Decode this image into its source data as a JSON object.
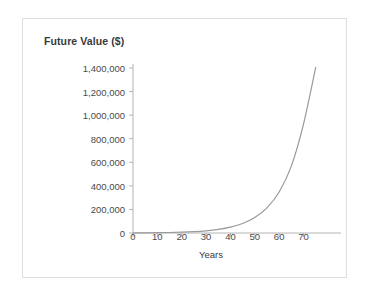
{
  "figure": {
    "title": "Future Value ($)",
    "border_color": "#dededd",
    "background": "#ffffff"
  },
  "chart_data": {
    "type": "line",
    "title": "Future Value ($)",
    "xlabel": "Years",
    "ylabel": "Future Value ($)",
    "xlim": [
      0,
      78
    ],
    "ylim": [
      0,
      1400000
    ],
    "grid": false,
    "legend": null,
    "line_color": "#9a9a9a",
    "line_width": 1.2,
    "x_ticks": [
      0,
      10,
      20,
      30,
      40,
      50,
      60,
      70
    ],
    "x_tick_labels": [
      "0",
      "10",
      "20",
      "30",
      "40",
      "50",
      "60",
      "70"
    ],
    "y_ticks": [
      0,
      200000,
      400000,
      600000,
      800000,
      1000000,
      1200000,
      1400000
    ],
    "y_tick_labels": [
      "0",
      "200,000",
      "400,000",
      "600,000",
      "800,000",
      "1,000,000",
      "1,200,000",
      "1,400,000"
    ],
    "series": [
      {
        "name": "Future Value",
        "x": [
          0,
          5,
          10,
          15,
          20,
          25,
          30,
          35,
          40,
          45,
          50,
          55,
          60,
          65,
          70,
          75
        ],
        "values": [
          1000,
          1630,
          2650,
          4320,
          7030,
          11450,
          18650,
          30380,
          49490,
          80600,
          131300,
          213900,
          348400,
          567500,
          924400,
          1405000
        ]
      }
    ]
  },
  "axis": {
    "line_color": "#b4b4b4",
    "tick_color": "#b4b4b4",
    "text_color": "#4a4a4a"
  }
}
